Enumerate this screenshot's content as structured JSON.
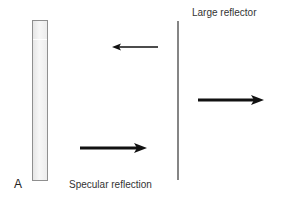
{
  "diagram": {
    "panel_label": "A",
    "labels": {
      "reflector": "Large reflector",
      "reflection": "Specular reflection"
    },
    "elements": {
      "transducer": {
        "type": "vertical-bar",
        "color": "#e8e8e8",
        "border": "#8f8f8f"
      },
      "reflector": {
        "type": "vertical-line",
        "color": "#858585"
      }
    },
    "arrows": [
      {
        "name": "reflected-echo",
        "direction": "left",
        "weight": "thin",
        "x1": 158,
        "x2": 112,
        "y": 47
      },
      {
        "name": "transmitted-beam",
        "direction": "right",
        "weight": "thick",
        "x1": 198,
        "x2": 263,
        "y": 100
      },
      {
        "name": "incident-beam",
        "direction": "right",
        "weight": "thick",
        "x1": 80,
        "x2": 146,
        "y": 148
      }
    ],
    "colors": {
      "arrow": "#111111",
      "text": "#333333"
    }
  }
}
